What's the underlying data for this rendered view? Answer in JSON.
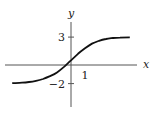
{
  "chart_data": {
    "type": "line",
    "title": "",
    "xlabel": "x",
    "ylabel": "y",
    "xlim": [
      -4.6,
      4.7
    ],
    "ylim": [
      -4.6,
      4.7
    ],
    "grid": false,
    "x_ticks": [
      {
        "value": 1,
        "label": "1"
      }
    ],
    "y_ticks": [
      {
        "value": 3,
        "label": "3"
      },
      {
        "value": -2,
        "label": "−2"
      }
    ],
    "asymptotes": {
      "upper": 3,
      "lower": -2
    },
    "series": [
      {
        "name": "curve",
        "x": [
          -4.2,
          -3.5,
          -3,
          -2.5,
          -2,
          -1.5,
          -1,
          -0.5,
          0,
          0.5,
          1,
          1.5,
          2,
          2.5,
          3,
          3.5,
          4.2
        ],
        "y": [
          -1.96,
          -1.9,
          -1.83,
          -1.7,
          -1.5,
          -1.2,
          -0.8,
          -0.2,
          0.5,
          1.2,
          1.8,
          2.3,
          2.6,
          2.8,
          2.9,
          2.95,
          2.98
        ]
      }
    ]
  }
}
